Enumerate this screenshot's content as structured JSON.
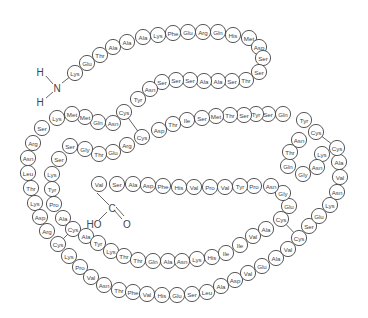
{
  "n_terminus": {
    "atoms": [
      "H",
      "N",
      "H"
    ]
  },
  "c_terminus": {
    "atoms": [
      "HO",
      "C",
      "O"
    ]
  },
  "sequence": [
    "Lys",
    "Glu",
    "Thr",
    "Ala",
    "Ala",
    "Ala",
    "Lys",
    "Phe",
    "Glu",
    "Arg",
    "Gln",
    "His",
    "Met",
    "Asp",
    "Ser",
    "Ser",
    "Thr",
    "Ser",
    "Ala",
    "Ala",
    "Ser",
    "Ser",
    "Ser",
    "Asn",
    "Tyr",
    "Cys",
    "Asn",
    "Gln",
    "Met",
    "Met",
    "Lys",
    "Ser",
    "Arg",
    "Asn",
    "Leu",
    "Thr",
    "Lys",
    "Asp",
    "Arg",
    "Cys",
    "Lys",
    "Pro",
    "Val",
    "Asn",
    "Thr",
    "Phe",
    "Val",
    "His",
    "Glu",
    "Ser",
    "Leu",
    "Ala",
    "Asp",
    "Val",
    "Glu",
    "Ala",
    "Val",
    "Cys",
    "Ser",
    "Glu",
    "Lys",
    "Asn",
    "Val",
    "Ala",
    "Cys",
    "Lys",
    "Asn",
    "Gly",
    "Gln",
    "Thr",
    "Asn",
    "Cys",
    "Tyr",
    "Gln",
    "Ser",
    "Tyr",
    "Ser",
    "Thr",
    "Met",
    "Ser",
    "Ile",
    "Thr",
    "Asp",
    "Cys",
    "Arg",
    "Glu",
    "Thr",
    "Gly",
    "Ser",
    "Ser",
    "Lys",
    "Tyr",
    "Pro",
    "Ala",
    "Cys",
    "Ala",
    "Tyr",
    "Lys",
    "Thr",
    "Thr",
    "Gln",
    "Ala",
    "Asn",
    "Lys",
    "His",
    "Ile",
    "Ile",
    "Val",
    "Ala",
    "Cys",
    "Glu",
    "Gly",
    "Asn",
    "Pro",
    "Tyr",
    "Val",
    "Pro",
    "Val",
    "His",
    "Phe",
    "Asp",
    "Ala",
    "Ser",
    "Val"
  ],
  "disulfide_bonds": [
    [
      26,
      84
    ],
    [
      40,
      95
    ],
    [
      65,
      72
    ],
    [
      58,
      110
    ]
  ]
}
